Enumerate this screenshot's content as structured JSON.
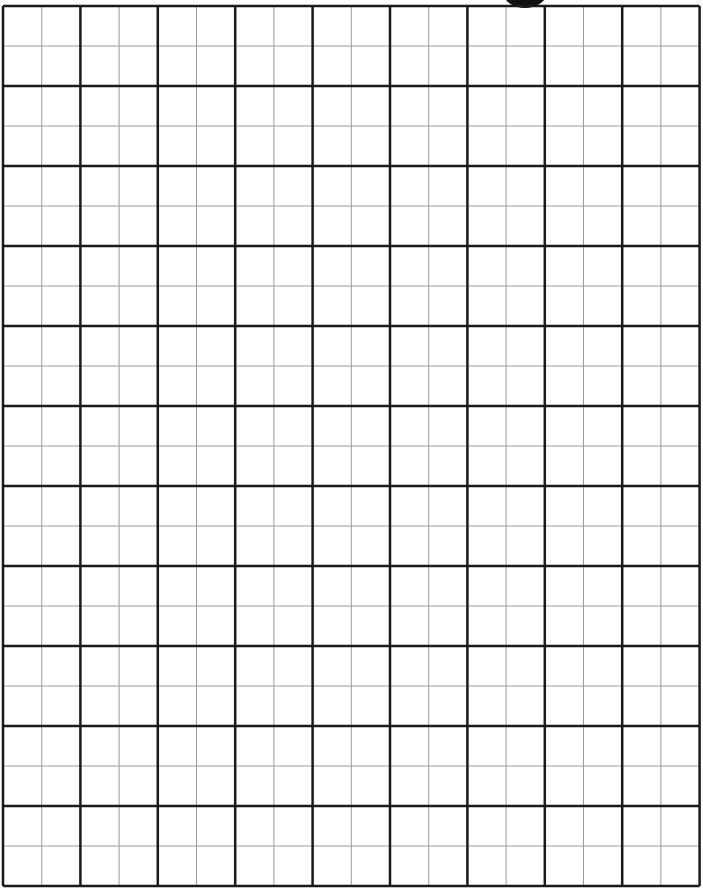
{
  "sheet": {
    "type": "graph-paper",
    "columns_major": 9,
    "rows_major": 11,
    "subdivisions": 2,
    "origin": [
      3,
      6
    ],
    "cell_width": 77.4,
    "cell_height": 80,
    "colors": {
      "background": "#ffffff",
      "major_line": "#1a1a1a",
      "minor_line": "#9a9a9a",
      "tab": "#111111"
    }
  }
}
